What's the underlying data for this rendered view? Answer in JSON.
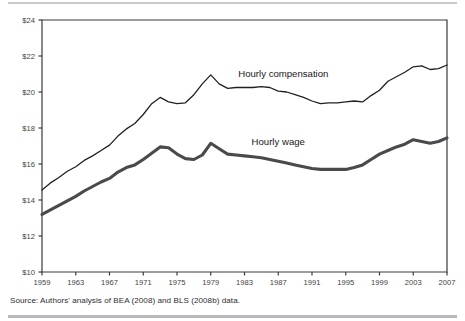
{
  "figure": {
    "source_note": "Source: Authors' analysis of BEA (2008) and BLS (2008b) data."
  },
  "chart_data": {
    "type": "line",
    "title": "",
    "subtitle": "",
    "xlabel": "",
    "ylabel": "",
    "xlim": [
      1959,
      2007
    ],
    "ylim": [
      10,
      24
    ],
    "grid": false,
    "legend": "inline-labels",
    "y_tick_labels": [
      "$24",
      "$22",
      "$20",
      "$18",
      "$16",
      "$14",
      "$12",
      "$10"
    ],
    "y_tick_values": [
      24,
      22,
      20,
      18,
      16,
      14,
      12,
      10
    ],
    "x_tick_labels": [
      "1959",
      "1963",
      "1967",
      "1971",
      "1975",
      "1979",
      "1983",
      "1987",
      "1991",
      "1995",
      "1999",
      "2003",
      "2007"
    ],
    "x_tick_values": [
      1959,
      1963,
      1967,
      1971,
      1975,
      1979,
      1983,
      1987,
      1991,
      1995,
      1999,
      2003,
      2007
    ],
    "x": [
      1959,
      1960,
      1961,
      1962,
      1963,
      1964,
      1965,
      1966,
      1967,
      1968,
      1969,
      1970,
      1971,
      1972,
      1973,
      1974,
      1975,
      1976,
      1977,
      1978,
      1979,
      1980,
      1981,
      1982,
      1983,
      1984,
      1985,
      1986,
      1987,
      1988,
      1989,
      1990,
      1991,
      1992,
      1993,
      1994,
      1995,
      1996,
      1997,
      1998,
      1999,
      2000,
      2001,
      2002,
      2003,
      2004,
      2005,
      2006,
      2007
    ],
    "series": [
      {
        "name": "Hourly compensation",
        "label": "Hourly compensation",
        "label_x": 1987.6,
        "label_y": 20.85,
        "color": "#231f20",
        "style": "thin",
        "values": [
          14.55,
          14.95,
          15.25,
          15.6,
          15.85,
          16.2,
          16.45,
          16.75,
          17.05,
          17.55,
          17.95,
          18.25,
          18.75,
          19.35,
          19.7,
          19.45,
          19.35,
          19.4,
          19.85,
          20.45,
          20.95,
          20.45,
          20.2,
          20.25,
          20.25,
          20.25,
          20.3,
          20.25,
          20.05,
          20.0,
          19.85,
          19.7,
          19.5,
          19.35,
          19.4,
          19.4,
          19.45,
          19.5,
          19.45,
          19.8,
          20.1,
          20.6,
          20.85,
          21.1,
          21.4,
          21.45,
          21.25,
          21.3,
          21.5
        ]
      },
      {
        "name": "Hourly wage",
        "label": "Hourly wage",
        "label_x": 1987.0,
        "label_y": 17.05,
        "color": "#4a4a4e",
        "style": "thick",
        "values": [
          13.2,
          13.45,
          13.7,
          13.95,
          14.2,
          14.5,
          14.75,
          15.0,
          15.2,
          15.55,
          15.8,
          15.95,
          16.25,
          16.6,
          16.95,
          16.9,
          16.55,
          16.3,
          16.25,
          16.5,
          17.15,
          16.85,
          16.55,
          16.5,
          16.45,
          16.4,
          16.35,
          16.25,
          16.15,
          16.05,
          15.95,
          15.85,
          15.75,
          15.7,
          15.7,
          15.7,
          15.7,
          15.8,
          15.95,
          16.25,
          16.55,
          16.75,
          16.95,
          17.1,
          17.35,
          17.25,
          17.15,
          17.25,
          17.45
        ]
      }
    ]
  }
}
